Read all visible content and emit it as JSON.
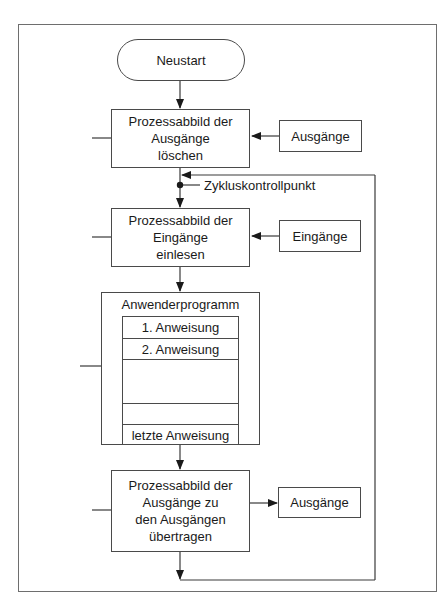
{
  "diagram": {
    "type": "flowchart",
    "start": {
      "label": "Neustart"
    },
    "steps": [
      {
        "id": "clear_outputs",
        "label": "Prozessabbild der\nAusgänge\nlöschen",
        "side_input": "Ausgänge"
      },
      {
        "id": "read_inputs",
        "label": "Prozessabbild der\nEingänge\neinlesen",
        "side_input": "Eingänge"
      },
      {
        "id": "user_program",
        "label": "Anwenderprogramm",
        "instructions": [
          "1. Anweisung",
          "2. Anweisung",
          "",
          "",
          "letzte Anweisung"
        ]
      },
      {
        "id": "write_outputs",
        "label": "Prozessabbild der\nAusgänge zu\nden Ausgängen\nübertragen",
        "side_output": "Ausgänge"
      }
    ],
    "cycle_checkpoint": {
      "label": "Zykluskontrollpunkt"
    }
  }
}
